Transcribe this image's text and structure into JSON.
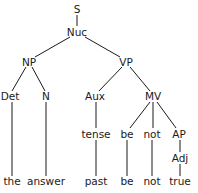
{
  "diagram": {
    "type": "syntax-tree",
    "nodes": {
      "S": {
        "label": "S",
        "x": 77,
        "y": 9
      },
      "Nuc": {
        "label": "Nuc",
        "x": 77,
        "y": 32
      },
      "NP": {
        "label": "NP",
        "x": 29,
        "y": 62
      },
      "VP": {
        "label": "VP",
        "x": 126,
        "y": 62
      },
      "Det": {
        "label": "Det",
        "x": 10,
        "y": 96
      },
      "N": {
        "label": "N",
        "x": 46,
        "y": 96
      },
      "Aux": {
        "label": "Aux",
        "x": 95,
        "y": 96
      },
      "MV": {
        "label": "MV",
        "x": 153,
        "y": 96
      },
      "tense": {
        "label": "tense",
        "x": 96,
        "y": 134
      },
      "be1": {
        "label": "be",
        "x": 127,
        "y": 134
      },
      "not1": {
        "label": "not",
        "x": 152,
        "y": 134
      },
      "AP": {
        "label": "AP",
        "x": 179,
        "y": 134
      },
      "Adj": {
        "label": "Adj",
        "x": 180,
        "y": 158
      },
      "the": {
        "label": "the",
        "x": 12,
        "y": 181
      },
      "answer": {
        "label": "answer",
        "x": 46,
        "y": 181
      },
      "past": {
        "label": "past",
        "x": 96,
        "y": 181
      },
      "be2": {
        "label": "be",
        "x": 127,
        "y": 181
      },
      "not2": {
        "label": "not",
        "x": 152,
        "y": 181
      },
      "true": {
        "label": "true",
        "x": 180,
        "y": 181
      }
    },
    "edges": [
      [
        "S",
        "Nuc"
      ],
      [
        "Nuc",
        "NP"
      ],
      [
        "Nuc",
        "VP"
      ],
      [
        "NP",
        "Det"
      ],
      [
        "NP",
        "N"
      ],
      [
        "VP",
        "Aux"
      ],
      [
        "VP",
        "MV"
      ],
      [
        "Det",
        "the"
      ],
      [
        "N",
        "answer"
      ],
      [
        "Aux",
        "tense"
      ],
      [
        "tense",
        "past"
      ],
      [
        "MV",
        "be1"
      ],
      [
        "MV",
        "not1"
      ],
      [
        "MV",
        "AP"
      ],
      [
        "be1",
        "be2"
      ],
      [
        "not1",
        "not2"
      ],
      [
        "AP",
        "Adj"
      ],
      [
        "Adj",
        "true"
      ]
    ],
    "sentence": [
      "the",
      "answer",
      "past",
      "be",
      "not",
      "true"
    ]
  }
}
